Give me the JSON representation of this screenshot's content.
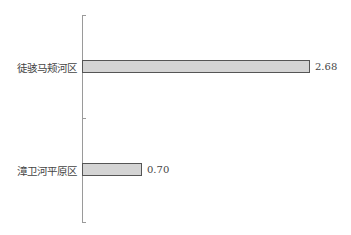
{
  "chart_data": {
    "type": "bar",
    "orientation": "horizontal",
    "title": "",
    "xlabel": "",
    "ylabel": "",
    "categories": [
      "徒骇马颊河区",
      "漳卫河平原区"
    ],
    "values": [
      2.68,
      0.7
    ],
    "value_labels": [
      "2.68",
      "0.70"
    ],
    "xlim": [
      0,
      2.8
    ],
    "grid": false,
    "legend": null,
    "bar_color": "#d4d4d4",
    "bar_edge_color": "#555555"
  }
}
